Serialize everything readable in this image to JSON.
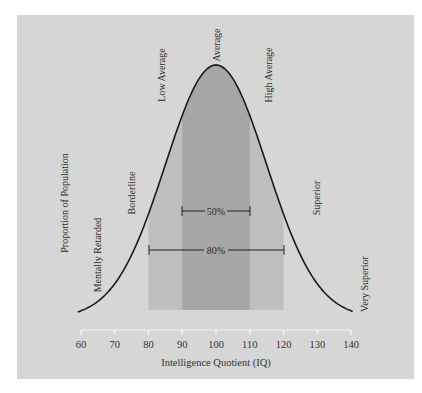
{
  "chart_data": {
    "type": "area",
    "title": "",
    "xlabel": "Intelligence Quotient (IQ)",
    "ylabel": "Proportion of Population",
    "xlim": [
      60,
      140
    ],
    "x_ticks": [
      60,
      70,
      80,
      90,
      100,
      110,
      120,
      130,
      140
    ],
    "distribution": {
      "kind": "normal",
      "mean": 100,
      "sd": 15
    },
    "shaded_bands": [
      {
        "label": "80%",
        "from": 80,
        "to": 120,
        "color": "#bfbfbf"
      },
      {
        "label": "50%",
        "from": 90,
        "to": 110,
        "color": "#a6a6a6"
      }
    ],
    "category_labels": [
      {
        "text": "Mentally Retarded",
        "approx_iq": 65
      },
      {
        "text": "Borderline",
        "approx_iq": 75
      },
      {
        "text": "Low Average",
        "approx_iq": 84
      },
      {
        "text": "Average",
        "approx_iq": 100
      },
      {
        "text": "High Average",
        "approx_iq": 116
      },
      {
        "text": "Superior",
        "approx_iq": 130
      },
      {
        "text": "Very Superior",
        "approx_iq": 144
      }
    ],
    "annotations": [
      {
        "text": "50%",
        "span": [
          90,
          110
        ]
      },
      {
        "text": "80%",
        "span": [
          80,
          120
        ]
      }
    ],
    "grid": false,
    "legend": "none"
  },
  "labels": {
    "ylabel": "Proportion of Population",
    "xlabel": "Intelligence Quotient (IQ)",
    "mentally_retarded": "Mentally Retarded",
    "borderline": "Borderline",
    "low_average": "Low Average",
    "average": "Average",
    "high_average": "High Average",
    "superior": "Superior",
    "very_superior": "Very Superior",
    "pct50": "50%",
    "pct80": "80%"
  },
  "ticks": [
    "60",
    "70",
    "80",
    "90",
    "100",
    "110",
    "120",
    "130",
    "140"
  ],
  "colors": {
    "panel": "#d6d6d6",
    "band_outer": "#bfbfbf",
    "band_inner": "#a6a6a6",
    "curve": "#1a1a1a",
    "axis": "#f2f2f2"
  }
}
